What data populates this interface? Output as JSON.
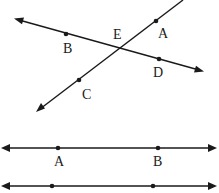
{
  "figure_top": {
    "lines": [
      {
        "name": "line-BD",
        "through": [
          "B",
          "E",
          "D"
        ]
      },
      {
        "name": "line-CA",
        "through": [
          "C",
          "E",
          "A"
        ]
      }
    ],
    "points": {
      "A": "A",
      "B": "B",
      "C": "C",
      "D": "D",
      "E": "E"
    },
    "intersection": "E"
  },
  "figure_middle": {
    "points": {
      "A": "A",
      "B": "B"
    }
  },
  "figure_bottom": {
    "points_labeled": false
  },
  "colors": {
    "ink": "#1a1a1a",
    "background": "#ffffff"
  }
}
